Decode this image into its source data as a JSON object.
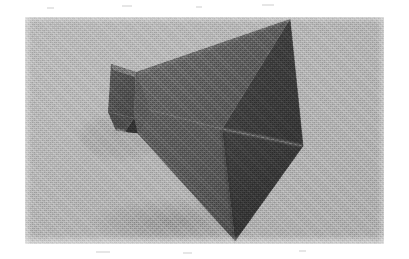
{
  "page": {
    "background_color": "#ffffff",
    "width": 409,
    "height": 259,
    "caption": ""
  },
  "photo": {
    "name": "pyramidal-horn-antenna-photograph",
    "alt_text": "Grayscale photograph of a pyramidal horn antenna resting on a plain gray background",
    "frame": {
      "x": 25,
      "y": 17,
      "width": 359,
      "height": 227
    },
    "background_color": "#b2b2b2",
    "background_color_dark": "#a6a6a6",
    "rendering": "halftone-dither-scan"
  },
  "object": {
    "name": "pyramidal-horn-antenna",
    "description": "Four-sided pyramidal horn flaring from a small rectangular waveguide throat at the left to a large rectangular aperture at the right",
    "colors": {
      "face_upper_left": "#5f5f5f",
      "face_lower_left": "#565656",
      "face_aperture_upper": "#3c3c3c",
      "face_aperture_lower": "#343434",
      "face_throat_front": "#565656",
      "face_throat_side": "#4a4a4a",
      "throat_flange": "#6a6a6a",
      "edge_highlight": "#7a7a7a",
      "shadow": "#8f8f8f"
    },
    "vertices": {
      "throat_top_back": [
        111,
        64
      ],
      "throat_top_front": [
        136,
        72
      ],
      "throat_bottom_front": [
        134,
        118
      ],
      "throat_bottom_back": [
        108,
        112
      ],
      "throat_tip": [
        118,
        131
      ],
      "aperture_top": [
        290,
        19
      ],
      "aperture_right": [
        303,
        146
      ],
      "aperture_bottom": [
        235,
        241
      ],
      "aperture_center": [
        222,
        129
      ]
    }
  },
  "marks": {
    "label": "scan speckles",
    "items": [
      {
        "x": 47,
        "y": 7,
        "w": 7,
        "h": 2
      },
      {
        "x": 122,
        "y": 5,
        "w": 10,
        "h": 2
      },
      {
        "x": 196,
        "y": 6,
        "w": 6,
        "h": 2
      },
      {
        "x": 262,
        "y": 4,
        "w": 12,
        "h": 2
      },
      {
        "x": 96,
        "y": 251,
        "w": 14,
        "h": 2
      },
      {
        "x": 183,
        "y": 252,
        "w": 9,
        "h": 2
      },
      {
        "x": 299,
        "y": 250,
        "w": 7,
        "h": 2
      }
    ]
  }
}
